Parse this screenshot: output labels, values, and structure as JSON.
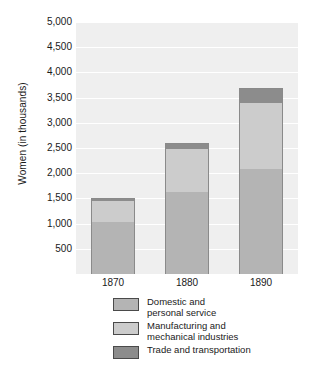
{
  "chart_data": {
    "type": "bar",
    "subtype": "stacked-bar",
    "title": "",
    "xlabel": "",
    "ylabel": "Women (in thousands)",
    "categories": [
      "1870",
      "1880",
      "1890"
    ],
    "ylim": [
      0,
      5000
    ],
    "ytick_labels": [
      "5,000",
      "4,500",
      "4,000",
      "3,500",
      "3,000",
      "2,500",
      "2,000",
      "1,500",
      "1,000",
      "500"
    ],
    "ytick_values": [
      5000,
      4500,
      4000,
      3500,
      3000,
      2500,
      2000,
      1500,
      1000,
      500
    ],
    "grid": true,
    "legend_position": "bottom",
    "series": [
      {
        "name": "Domestic and\npersonal service",
        "color": "#b4b4b4",
        "values": [
          1030,
          1630,
          2080
        ]
      },
      {
        "name": "Manufacturing and\nmechanical industries",
        "color": "#cccccc",
        "values": [
          420,
          850,
          1320
        ]
      },
      {
        "name": "Trade and transportation",
        "color": "#8c8c8c",
        "values": [
          50,
          120,
          300
        ]
      }
    ],
    "totals": [
      1500,
      2600,
      3700
    ],
    "plot_background": "#efefef",
    "gridline_color": "#ffffff",
    "bar_border_color": "#8a8a8a"
  },
  "legend": {
    "items": [
      {
        "label": "Domestic and\npersonal service",
        "color": "#b4b4b4"
      },
      {
        "label": "Manufacturing and\nmechanical industries",
        "color": "#cccccc"
      },
      {
        "label": "Trade and transportation",
        "color": "#8c8c8c"
      }
    ]
  }
}
